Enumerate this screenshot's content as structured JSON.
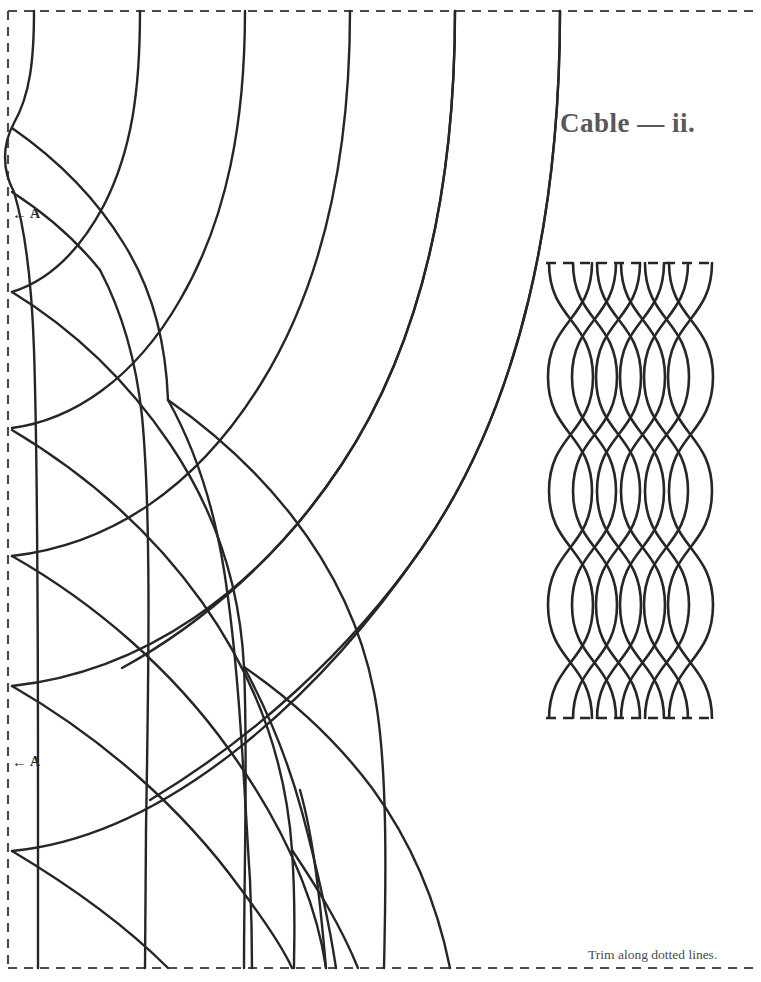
{
  "page": {
    "width": 761,
    "height": 982,
    "background": "#ffffff",
    "ink": "#262628",
    "title_color": "#58585a"
  },
  "title": {
    "text": "Cable — ii."
  },
  "footer": {
    "trim_note": "Trim along dotted lines."
  },
  "markers": [
    {
      "id": "a-top",
      "arrow": "←",
      "label": "A",
      "x": 12,
      "y": 206
    },
    {
      "id": "a-bottom",
      "arrow": "←",
      "label": "A",
      "x": 12,
      "y": 754
    }
  ],
  "trim_frame": {
    "style": "dashed",
    "left_x": 8,
    "top_y": 11,
    "bottom_y": 968,
    "right_x": 752,
    "dash": "9 7",
    "stroke": "#4b4b4d",
    "stroke_width": 2.2
  },
  "cable_swatch": {
    "label": "cable-braid-swatch",
    "left": 545,
    "right": 716,
    "top": 263,
    "bottom": 718,
    "strands": 8,
    "strand_spacing": 24.4,
    "wave_period": 228,
    "stroke": "#262628",
    "stroke_width": 2.6,
    "edge_dash": "10 7"
  },
  "lattice": {
    "label": "knotwork-grid",
    "family_a_label": "descending-arcs",
    "family_b_label": "left-edge-arcs",
    "top_curve_starts_x": [
      34,
      140,
      245,
      350,
      455,
      560
    ],
    "bottom_curve_ends_x": [
      38,
      145,
      252,
      355,
      458
    ],
    "left_vertices_y": [
      128,
      293,
      430,
      557,
      687,
      852
    ],
    "stroke": "#262628",
    "stroke_width": 2.4
  },
  "icons": {
    "left_arrow": "←"
  }
}
